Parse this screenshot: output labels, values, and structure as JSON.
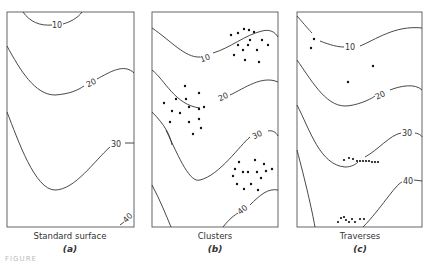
{
  "figure": {
    "caption_fragment": "FIGURE",
    "panels": [
      {
        "id": "a",
        "title": "Standard surface",
        "letter": "(a)"
      },
      {
        "id": "b",
        "title": "Clusters",
        "letter": "(b)"
      },
      {
        "id": "c",
        "title": "Traverses",
        "letter": "(c)"
      }
    ],
    "contour_labels": [
      "10",
      "20",
      "30",
      "40"
    ],
    "colors": {
      "line": "#333333",
      "frame": "#555555",
      "dots": "#111111",
      "background": "#ffffff"
    }
  }
}
